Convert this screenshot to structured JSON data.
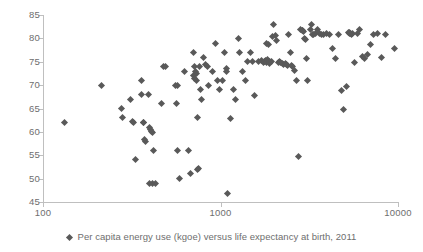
{
  "chart_data": {
    "type": "scatter",
    "title": "",
    "subtitle": "",
    "xlabel": "",
    "ylabel": "",
    "xscale": "log",
    "yscale": "linear",
    "xlim": [
      100,
      10000
    ],
    "ylim": [
      45,
      85
    ],
    "xticks": [
      100,
      1000,
      10000
    ],
    "xticklabels": [
      "100",
      "1000",
      "10000"
    ],
    "yticks": [
      45,
      50,
      55,
      60,
      65,
      70,
      75,
      80,
      85
    ],
    "yticklabels": [
      "45",
      "50",
      "55",
      "60",
      "65",
      "70",
      "75",
      "80",
      "85"
    ],
    "grid": false,
    "legend_position": "bottom",
    "marker": "diamond",
    "marker_color": "#595959",
    "axis_color": "#bfbfbf",
    "series": [
      {
        "name": "Per capita energy use (kgoe) versus life expectancy at birth, 2011",
        "points": [
          [
            133,
            62.0
          ],
          [
            213,
            70.0
          ],
          [
            276,
            65.0
          ],
          [
            281,
            63.0
          ],
          [
            312,
            67.0
          ],
          [
            318,
            62.3
          ],
          [
            322,
            62.0
          ],
          [
            330,
            54.0
          ],
          [
            358,
            71.0
          ],
          [
            360,
            68.0
          ],
          [
            366,
            62.0
          ],
          [
            370,
            61.9
          ],
          [
            374,
            58.3
          ],
          [
            378,
            58.0
          ],
          [
            392,
            68.0
          ],
          [
            398,
            61.0
          ],
          [
            402,
            60.6
          ],
          [
            410,
            60.0
          ],
          [
            416,
            59.9
          ],
          [
            420,
            56.0
          ],
          [
            400,
            49.0
          ],
          [
            414,
            49.0
          ],
          [
            428,
            49.0
          ],
          [
            466,
            66.0
          ],
          [
            480,
            74.0
          ],
          [
            492,
            74.0
          ],
          [
            560,
            70.0
          ],
          [
            575,
            70.0
          ],
          [
            566,
            66.0
          ],
          [
            572,
            56.0
          ],
          [
            590,
            50.0
          ],
          [
            630,
            73.0
          ],
          [
            660,
            56.0
          ],
          [
            676,
            51.0
          ],
          [
            700,
            77.0
          ],
          [
            706,
            72.0
          ],
          [
            712,
            71.5
          ],
          [
            718,
            74.0
          ],
          [
            722,
            73.0
          ],
          [
            728,
            72.5
          ],
          [
            734,
            71.0
          ],
          [
            740,
            63.0
          ],
          [
            745,
            52.0
          ],
          [
            752,
            52.2
          ],
          [
            762,
            74.0
          ],
          [
            770,
            69.0
          ],
          [
            778,
            67.0
          ],
          [
            800,
            76.0
          ],
          [
            820,
            74.5
          ],
          [
            840,
            74.0
          ],
          [
            860,
            70.0
          ],
          [
            900,
            73.0
          ],
          [
            940,
            79.0
          ],
          [
            960,
            71.0
          ],
          [
            985,
            69.0
          ],
          [
            1020,
            71.0
          ],
          [
            1060,
            77.0
          ],
          [
            1075,
            73.5
          ],
          [
            1085,
            73.0
          ],
          [
            1095,
            46.9
          ],
          [
            1140,
            62.8
          ],
          [
            1180,
            69.0
          ],
          [
            1210,
            67.0
          ],
          [
            1260,
            80.0
          ],
          [
            1280,
            77.0
          ],
          [
            1330,
            73.0
          ],
          [
            1390,
            71.0
          ],
          [
            1420,
            75.0
          ],
          [
            1470,
            77.0
          ],
          [
            1520,
            75.0
          ],
          [
            1560,
            67.8
          ],
          [
            1640,
            75.0
          ],
          [
            1700,
            75.3
          ],
          [
            1740,
            74.8
          ],
          [
            1760,
            75.0
          ],
          [
            1790,
            75.2
          ],
          [
            1820,
            74.9
          ],
          [
            1850,
            75.4
          ],
          [
            1880,
            74.7
          ],
          [
            1900,
            75.0
          ],
          [
            1930,
            75.1
          ],
          [
            1820,
            79.0
          ],
          [
            1870,
            78.7
          ],
          [
            1960,
            80.3
          ],
          [
            2000,
            82.9
          ],
          [
            2040,
            80.6
          ],
          [
            2080,
            79.6
          ],
          [
            2110,
            74.9
          ],
          [
            2150,
            75.0
          ],
          [
            2190,
            74.8
          ],
          [
            2230,
            74.6
          ],
          [
            2270,
            74.5
          ],
          [
            2310,
            74.7
          ],
          [
            2350,
            74.4
          ],
          [
            2400,
            74.2
          ],
          [
            2430,
            80.9
          ],
          [
            2470,
            76.9
          ],
          [
            2520,
            74.3
          ],
          [
            2560,
            74.0
          ],
          [
            2620,
            73.1
          ],
          [
            2680,
            71.0
          ],
          [
            2760,
            54.8
          ],
          [
            2840,
            81.8
          ],
          [
            2880,
            81.7
          ],
          [
            2910,
            81.6
          ],
          [
            2950,
            81.5
          ],
          [
            2990,
            80.0
          ],
          [
            3010,
            79.8
          ],
          [
            3060,
            75.8
          ],
          [
            3110,
            70.9
          ],
          [
            3200,
            82.0
          ],
          [
            3260,
            82.9
          ],
          [
            3310,
            80.9
          ],
          [
            3360,
            80.8
          ],
          [
            3420,
            81.0
          ],
          [
            3520,
            82.0
          ],
          [
            3620,
            81.0
          ],
          [
            3700,
            80.9
          ],
          [
            3820,
            80.8
          ],
          [
            3960,
            81.0
          ],
          [
            4100,
            80.9
          ],
          [
            4300,
            77.8
          ],
          [
            4450,
            75.8
          ],
          [
            4600,
            80.9
          ],
          [
            4800,
            68.8
          ],
          [
            4950,
            64.8
          ],
          [
            5100,
            69.8
          ],
          [
            5250,
            81.3
          ],
          [
            5300,
            81.2
          ],
          [
            5360,
            81.1
          ],
          [
            5420,
            81.0
          ],
          [
            5480,
            80.9
          ],
          [
            5540,
            81.1
          ],
          [
            5700,
            74.8
          ],
          [
            5900,
            81.0
          ],
          [
            6100,
            82.0
          ],
          [
            6300,
            76.1
          ],
          [
            6500,
            75.7
          ],
          [
            6700,
            76.5
          ],
          [
            7000,
            78.7
          ],
          [
            7300,
            80.8
          ],
          [
            7700,
            81.0
          ],
          [
            8100,
            75.9
          ],
          [
            8500,
            80.8
          ],
          [
            9500,
            77.8
          ]
        ]
      }
    ]
  },
  "legend": {
    "marker_name": "diamond-marker",
    "label": "Per capita energy use (kgoe) versus life expectancy at birth, 2011"
  }
}
